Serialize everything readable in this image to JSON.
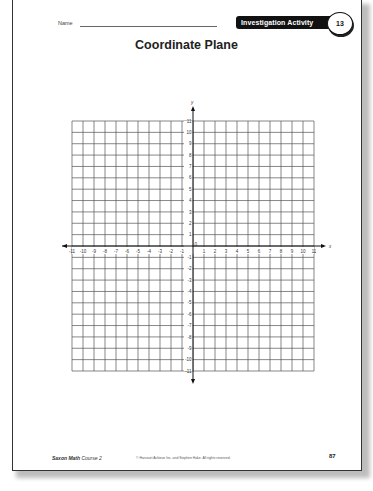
{
  "header": {
    "name_label": "Name",
    "badge_label": "Investigation Activity",
    "badge_number": "13"
  },
  "title": "Coordinate Plane",
  "chart_data": {
    "type": "coordinate-grid",
    "title": "Coordinate Plane",
    "xlabel": "x",
    "ylabel": "y",
    "xlim": [
      -11,
      11
    ],
    "ylim": [
      -11,
      11
    ],
    "x_ticks": [
      -11,
      -10,
      -9,
      -8,
      -7,
      -6,
      -5,
      -4,
      -3,
      -2,
      -1,
      1,
      2,
      3,
      4,
      5,
      6,
      7,
      8,
      9,
      10,
      11
    ],
    "y_ticks": [
      -11,
      -10,
      -9,
      -8,
      -7,
      -6,
      -5,
      -4,
      -3,
      -2,
      -1,
      1,
      2,
      3,
      4,
      5,
      6,
      7,
      8,
      9,
      10,
      11
    ],
    "origin_label": "0",
    "grid": true,
    "points": []
  },
  "footer": {
    "book_bold": "Saxon Math",
    "book_rest": " Course 2",
    "copyright": "© Harcourt Achieve Inc. and Stephen Hake. All rights reserved.",
    "page_number": "87"
  },
  "colors": {
    "grid": "#555555",
    "axis": "#111111",
    "badge_bg": "#111111"
  }
}
